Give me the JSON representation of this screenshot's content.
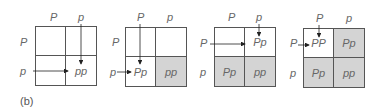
{
  "caption": "(b)",
  "colors": {
    "line": "#555555",
    "shade": "#d4d4d4",
    "text": "#666666"
  },
  "panels": [
    {
      "top_labels": [
        "P",
        "p"
      ],
      "left_labels": [
        "P",
        "p"
      ],
      "cells": {
        "tl": "",
        "tr": "",
        "bl": "",
        "br": "pp"
      },
      "shaded": {
        "tl": false,
        "tr": false,
        "bl": false,
        "br": false
      }
    },
    {
      "top_labels": [
        "P",
        "p"
      ],
      "left_labels": [
        "P",
        "p"
      ],
      "cells": {
        "tl": "",
        "tr": "",
        "bl": "Pp",
        "br": "pp"
      },
      "shaded": {
        "tl": false,
        "tr": false,
        "bl": false,
        "br": true
      }
    },
    {
      "top_labels": [
        "P",
        "p"
      ],
      "left_labels": [
        "P",
        "p"
      ],
      "cells": {
        "tl": "",
        "tr": "Pp",
        "bl": "Pp",
        "br": "pp"
      },
      "shaded": {
        "tl": false,
        "tr": false,
        "bl": true,
        "br": true
      }
    },
    {
      "top_labels": [
        "P",
        "p"
      ],
      "left_labels": [
        "P",
        "p"
      ],
      "cells": {
        "tl": "PP",
        "tr": "Pp",
        "bl": "Pp",
        "br": "pp"
      },
      "shaded": {
        "tl": false,
        "tr": true,
        "bl": true,
        "br": true
      }
    }
  ]
}
